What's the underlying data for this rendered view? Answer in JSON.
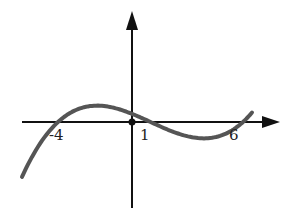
{
  "chart_data": {
    "type": "line",
    "title": "",
    "xlabel": "",
    "ylabel": "",
    "grid": false,
    "legend": null,
    "series": [
      {
        "name": "f(x)",
        "description": "cubic polynomial with roots at x = -4, 1, 6",
        "roots": [
          -4,
          1,
          6
        ],
        "local_max_x_approx": -1.7,
        "local_min_x_approx": 3.7,
        "y_intercept_sign": "positive"
      }
    ],
    "tick_labels": [
      {
        "text": "-4",
        "x": -4
      },
      {
        "text": "1",
        "x": 1
      },
      {
        "text": "6",
        "x": 6
      }
    ],
    "origin_marked": true,
    "xlim_approx": [
      -6.5,
      8.5
    ],
    "line_color": "#555555",
    "axis_color": "#111111"
  }
}
